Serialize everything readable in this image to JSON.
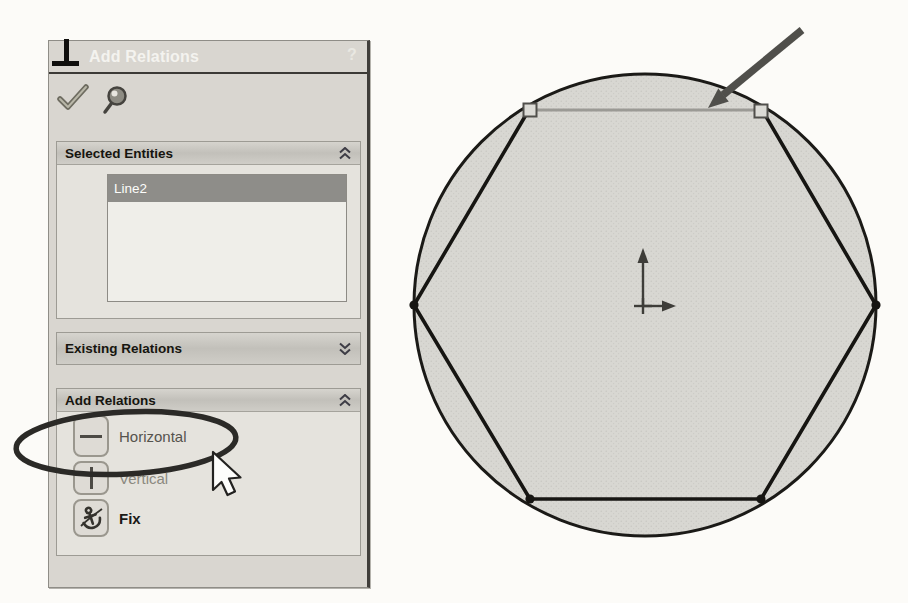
{
  "window": {
    "title": "Add Relations",
    "help_label": "?"
  },
  "toolbar": {
    "ok_icon": "checkmark",
    "pin_icon": "pushpin"
  },
  "sections": {
    "selected_entities": {
      "label": "Selected Entities",
      "collapse_state": "expanded",
      "items": [
        {
          "name": "Line2",
          "selected": true
        }
      ]
    },
    "existing_relations": {
      "label": "Existing Relations",
      "collapse_state": "collapsed"
    },
    "add_relations": {
      "label": "Add Relations",
      "collapse_state": "expanded",
      "relations": [
        {
          "label": "Horizontal",
          "icon": "horizontal-line-icon"
        },
        {
          "label": "Vertical",
          "icon": "vertical-line-icon"
        },
        {
          "label": "Fix",
          "icon": "anchor-icon"
        }
      ]
    }
  },
  "sketch": {
    "selected_entity": "Line2",
    "description": "hexagon inscribed in circle, top edge selected"
  },
  "annotations": {
    "circled_option": "Horizontal",
    "arrow_points_at": "top horizontal sketch line"
  },
  "colors": {
    "titlebar": "#56544f",
    "panel_bg": "#d9d6d0",
    "selection_row": "#8e8d89",
    "selected_line": "#9b9a95",
    "sketch_fill": "#d7d6d1",
    "sketch_line": "#171613",
    "annotation": "#2e2d2a"
  }
}
